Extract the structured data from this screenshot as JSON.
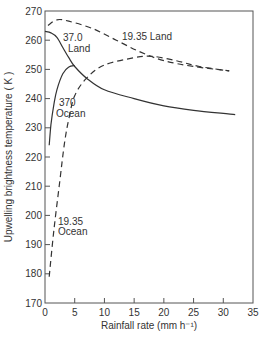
{
  "chart_data": {
    "type": "line",
    "title": "",
    "xlabel": "Rainfall rate (mm h⁻¹)",
    "ylabel": "Upwelling brightness temperature ( K )",
    "xlim": [
      0,
      35
    ],
    "ylim": [
      170,
      270
    ],
    "x_ticks": [
      0,
      5,
      10,
      15,
      20,
      25,
      30,
      35
    ],
    "y_ticks": [
      170,
      180,
      190,
      200,
      210,
      220,
      230,
      240,
      250,
      260,
      270
    ],
    "grid": false,
    "legend": "inline labels",
    "series": [
      {
        "name": "37.0 Land",
        "label_lines": [
          "37.0",
          "Land"
        ],
        "style": "solid",
        "points": [
          [
            0,
            263
          ],
          [
            1,
            262.5
          ],
          [
            2,
            261
          ],
          [
            3,
            257.5
          ],
          [
            4,
            254
          ],
          [
            5,
            251
          ],
          [
            7,
            247
          ],
          [
            10,
            243
          ],
          [
            15,
            240
          ],
          [
            20,
            237.5
          ],
          [
            25,
            236
          ],
          [
            32,
            234.5
          ]
        ]
      },
      {
        "name": "37.0 Ocean",
        "label_lines": [
          "370",
          "Ocean"
        ],
        "style": "solid",
        "points": [
          [
            0.7,
            224
          ],
          [
            1,
            231
          ],
          [
            1.5,
            238
          ],
          [
            2,
            243
          ],
          [
            3,
            248.5
          ],
          [
            4,
            250.8
          ],
          [
            5,
            251.3
          ]
        ]
      },
      {
        "name": "19.35 Land",
        "label_lines": [
          "19.35 Land"
        ],
        "style": "dashed",
        "points": [
          [
            0.5,
            265
          ],
          [
            2,
            267
          ],
          [
            4,
            266.5
          ],
          [
            8,
            264
          ],
          [
            12,
            260
          ],
          [
            16,
            256
          ],
          [
            20,
            253
          ],
          [
            25,
            251
          ],
          [
            31,
            249.5
          ]
        ]
      },
      {
        "name": "19.35 Ocean",
        "label_lines": [
          "19.35",
          "Ocean"
        ],
        "style": "dashed",
        "points": [
          [
            0.7,
            179
          ],
          [
            1.5,
            195
          ],
          [
            2.5,
            212
          ],
          [
            3.3,
            225
          ],
          [
            4,
            233
          ],
          [
            5,
            241
          ],
          [
            7,
            247
          ],
          [
            10,
            251.5
          ],
          [
            15,
            254
          ],
          [
            18,
            254.5
          ],
          [
            22,
            253
          ],
          [
            26,
            251
          ],
          [
            31,
            249.5
          ]
        ]
      }
    ]
  },
  "labels": {
    "x_axis": "Rainfall rate (mm h⁻¹)",
    "y_axis": "Upwelling  brightness  temperature ( K )",
    "s37_land_1": "37.0",
    "s37_land_2": "Land",
    "s37_ocean_1": "370",
    "s37_ocean_2": "Ocean",
    "s19_land": "19.35 Land",
    "s19_ocean_1": "19.35",
    "s19_ocean_2": "Ocean"
  }
}
